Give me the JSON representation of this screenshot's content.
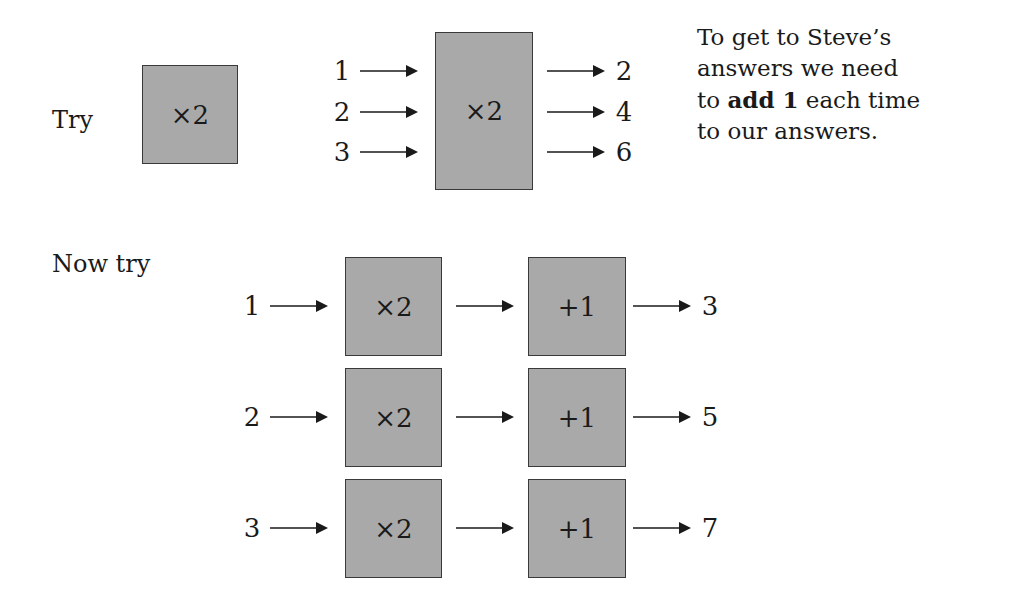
{
  "top": {
    "try_label": "Try",
    "single_box": {
      "operation": "×2"
    },
    "machine": {
      "operation": "×2",
      "inputs": [
        "1",
        "2",
        "3"
      ],
      "outputs": [
        "2",
        "4",
        "6"
      ]
    },
    "explanation": {
      "line1": "To get to Steve’s",
      "line2": "answers we need",
      "line3_pre": "to ",
      "line3_bold": "add 1",
      "line3_post": " each time",
      "line4": "to our answers."
    }
  },
  "bottom": {
    "now_try_label": "Now try",
    "rows": [
      {
        "input": "1",
        "op1": "×2",
        "op2": "+1",
        "output": "3"
      },
      {
        "input": "2",
        "op1": "×2",
        "op2": "+1",
        "output": "5"
      },
      {
        "input": "3",
        "op1": "×2",
        "op2": "+1",
        "output": "7"
      }
    ]
  },
  "colors": {
    "box_fill": "#a9a9a9",
    "box_border": "#3a3a3a",
    "text": "#1a1a1a"
  }
}
